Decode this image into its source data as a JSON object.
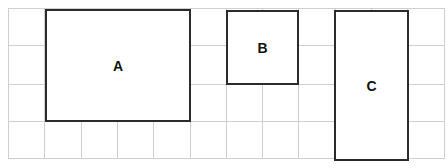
{
  "grid": {
    "line_color": "#cfcfcf",
    "x_lines": [
      8,
      44,
      81,
      117,
      153,
      190,
      226,
      262,
      298,
      335,
      371,
      407,
      444
    ],
    "y_lines": [
      8,
      45,
      84,
      121,
      158
    ],
    "left": 8,
    "top": 8,
    "right": 444,
    "bottom": 158
  },
  "shapes": [
    {
      "label": "A",
      "x": 45,
      "y": 9,
      "width": 146,
      "height": 113,
      "border_color": "#2b2b2b"
    },
    {
      "label": "B",
      "x": 226,
      "y": 10,
      "width": 73,
      "height": 75,
      "border_color": "#2b2b2b"
    },
    {
      "label": "C",
      "x": 334,
      "y": 10,
      "width": 75,
      "height": 151,
      "border_color": "#2b2b2b"
    }
  ]
}
